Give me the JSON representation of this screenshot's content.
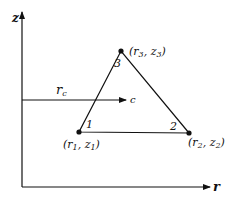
{
  "axes": {
    "vertical_label": "z",
    "horizontal_label": "r"
  },
  "centroid_marker": {
    "label_main": "r",
    "label_sub": "c",
    "arrow_target_label": "c"
  },
  "vertices": [
    {
      "number": "1",
      "coord_r": "r",
      "coord_r_sub": "1",
      "coord_z": "z",
      "coord_z_sub": "1"
    },
    {
      "number": "2",
      "coord_r": "r",
      "coord_r_sub": "2",
      "coord_z": "z",
      "coord_z_sub": "2"
    },
    {
      "number": "3",
      "coord_r": "r",
      "coord_r_sub": "3",
      "coord_z": "z",
      "coord_z_sub": "3"
    }
  ],
  "colors": {
    "ink": "#111111",
    "background": "#ffffff"
  }
}
